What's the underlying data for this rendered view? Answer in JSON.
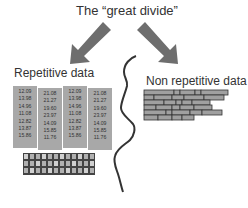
{
  "title": "The “great divide”",
  "left": {
    "label": "Repetitive data",
    "columns": [
      {
        "values": [
          "12.09",
          "13.98",
          "14.96",
          "11.08",
          "12.82",
          "13.87",
          "15.86"
        ]
      },
      {
        "values": [
          "21.08",
          "21.27",
          "19.60",
          "23.97",
          "14.09",
          "15.85",
          "11.76"
        ]
      },
      {
        "values": [
          "12.09",
          "13.98",
          "14.96",
          "11.08",
          "12.82",
          "13.87",
          "15.86"
        ]
      },
      {
        "values": [
          "21.08",
          "21.27",
          "19.60",
          "23.97",
          "14.09",
          "15.85",
          "11.76"
        ]
      }
    ],
    "grid_caption": "compressed repetitive record blocks"
  },
  "right": {
    "label": "Non repetitive data"
  },
  "colors": {
    "arrow": "#6e6e6e",
    "column_fill": "#a8a8a8",
    "line": "#333333",
    "brick": "#a0a0a0"
  }
}
